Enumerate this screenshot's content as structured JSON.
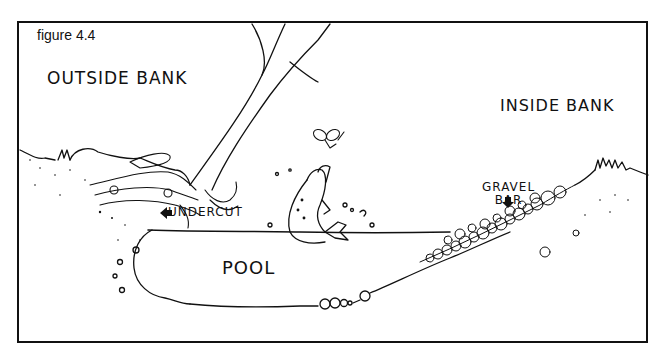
{
  "figure": {
    "label": "figure 4.4",
    "labels": {
      "outside_bank": "OUTSIDE BANK",
      "inside_bank": "INSIDE BANK",
      "undercut": "UNDERCUT",
      "gravel_bar_line1": "GRAVEL",
      "gravel_bar_line2": "BAR",
      "pool": "POOL"
    },
    "elements": [
      "tree",
      "roots",
      "fish-jumping",
      "insect",
      "gravel-stones",
      "grass",
      "water-surface",
      "stream-bed"
    ],
    "colors": {
      "ink": "#111111",
      "background": "#ffffff"
    }
  }
}
